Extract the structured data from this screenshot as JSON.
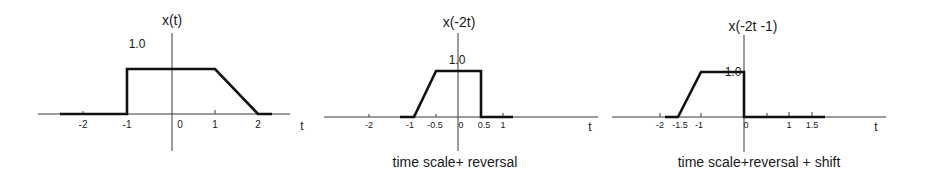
{
  "panels": [
    {
      "title": "x(t)",
      "amplitude_label": "1.0",
      "axis_label": "t",
      "caption": "",
      "ticks": [
        "-2",
        "-1",
        "0",
        "1",
        "2"
      ]
    },
    {
      "title": "x(-2t)",
      "amplitude_label": "1.0",
      "axis_label": "t",
      "caption": "time scale+ reversal",
      "ticks": [
        "-2",
        "-1",
        "-0.5",
        "0",
        "0.5",
        "1"
      ]
    },
    {
      "title": "x(-2t -1)",
      "amplitude_label": "1.0",
      "axis_label": "t",
      "caption": "time scale+reversal + shift",
      "ticks": [
        "-2",
        "-1.5",
        "-1",
        "0",
        "1",
        "1.5"
      ]
    }
  ],
  "signals": {
    "x_t": {
      "points": [
        [
          -2.5,
          0
        ],
        [
          -1,
          0
        ],
        [
          -1,
          1
        ],
        [
          1,
          1
        ],
        [
          2,
          0
        ],
        [
          2.3,
          0
        ]
      ]
    },
    "x_neg2t": {
      "points": [
        [
          -1.3,
          0
        ],
        [
          -1,
          0
        ],
        [
          -0.5,
          1
        ],
        [
          0.5,
          1
        ],
        [
          0.5,
          0
        ],
        [
          1.2,
          0
        ]
      ]
    },
    "x_neg2t_minus1": {
      "points": [
        [
          -1.9,
          0
        ],
        [
          -1.5,
          0
        ],
        [
          -1,
          1
        ],
        [
          0,
          1
        ],
        [
          0,
          0
        ],
        [
          1.75,
          0
        ]
      ]
    }
  },
  "colors": {
    "signal": "#111111",
    "axis": "#3a3a3a",
    "background": "#ffffff"
  }
}
